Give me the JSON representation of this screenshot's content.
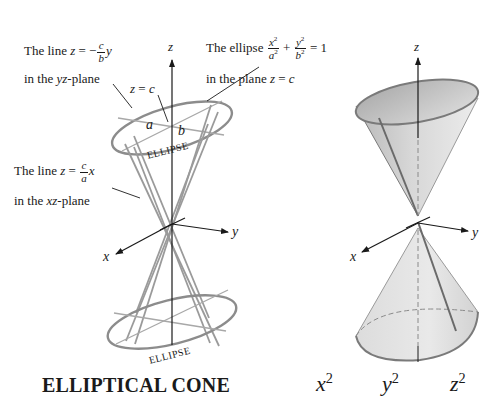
{
  "figure_title": "ELLIPTICAL CONE",
  "left_figure": {
    "annotations": {
      "line_yz": {
        "prefix": "The line ",
        "var": "z",
        "eq": " = −",
        "frac_num": "c",
        "frac_den": "b",
        "suffix_var": "y",
        "line2_pre": "in the ",
        "line2_var": "yz",
        "line2_post": "-plane"
      },
      "ellipse": {
        "prefix": "The ellipse ",
        "frac1_num": "x",
        "frac1_den": "a",
        "plus": " + ",
        "frac2_num": "y",
        "frac2_den": "b",
        "eq": " = 1",
        "exp": "2",
        "line2_pre": "in the plane ",
        "line2_var": "z",
        "line2_eq": " = ",
        "line2_val": "c"
      },
      "z_eq_c": {
        "var": "z",
        "eq": " = ",
        "val": "c"
      },
      "line_xz": {
        "prefix": "The line ",
        "var": "z",
        "eq": " = ",
        "frac_num": "c",
        "frac_den": "a",
        "suffix_var": "x",
        "line2_pre": "in the ",
        "line2_var": "xz",
        "line2_post": "-plane"
      },
      "semi_axis_a": "a",
      "semi_axis_b": "b",
      "ellipse_top_label": "ELLIPSE",
      "ellipse_bottom_label": "ELLIPSE"
    },
    "axes": {
      "x": "x",
      "y": "y",
      "z": "z"
    }
  },
  "right_figure": {
    "axes": {
      "x": "x",
      "y": "y",
      "z": "z"
    },
    "equation_partial": {
      "t1": "x",
      "t2": "y",
      "t3": "z",
      "exp": "2"
    }
  },
  "colors": {
    "ink": "#1a1a1a",
    "gray_lines": "#8c8c8c",
    "cone_fill_light": "#e6e6e6",
    "cone_fill_dark": "#bdbdbd",
    "rim": "#7a7a7a"
  }
}
